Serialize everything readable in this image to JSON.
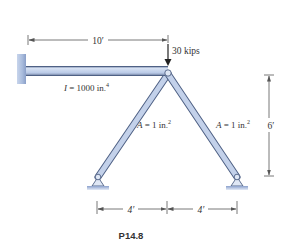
{
  "figure": {
    "caption": "P14.8",
    "load_label": "30 kips",
    "beam_label": "I = 1000 in.",
    "beam_label_sup": "4",
    "left_strut_label": "A = 1 in.",
    "left_strut_label_sup": "2",
    "right_strut_label": "A = 1 in.",
    "right_strut_label_sup": "2",
    "dim_beam_length": "10′",
    "dim_height": "6′",
    "dim_left_span": "4′",
    "dim_right_span": "4′"
  },
  "colors": {
    "member_fill": "#b9c9e6",
    "member_stroke": "#4f6185",
    "wall_fill": "#a8bbdc",
    "ground_fill": "#9fb3d8",
    "text": "#333333",
    "dimension": "#555555"
  }
}
